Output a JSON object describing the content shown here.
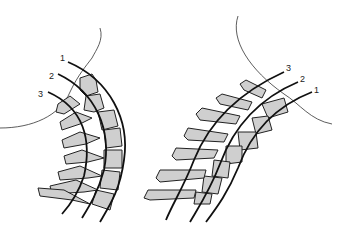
{
  "figure": {
    "left_panel": {
      "description": "Cervical spine in flexion with three reference lines",
      "line_labels": [
        "1",
        "2",
        "3"
      ]
    },
    "right_panel": {
      "description": "Cervical spine in extension with three reference lines",
      "line_labels": [
        "3",
        "2",
        "1"
      ]
    },
    "colors": {
      "bone_fill": "#cfcfcf",
      "line": "#111111",
      "background": "#ffffff"
    }
  }
}
